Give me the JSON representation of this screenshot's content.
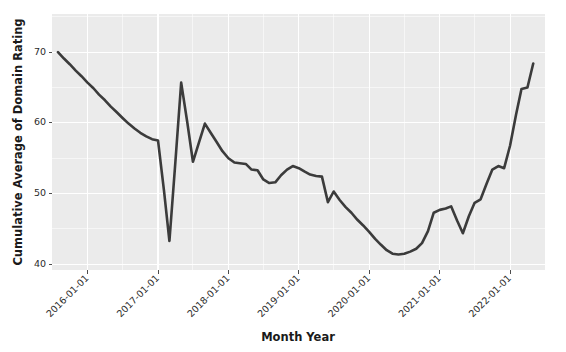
{
  "chart_data": {
    "type": "line",
    "title": "",
    "xlabel": "Month Year",
    "ylabel": "Cumulative Average of Domain Rating",
    "grid": true,
    "legend": false,
    "line_color": "#3b3b3b",
    "panel_color": "#ebebeb",
    "gridline_color": "#ffffff",
    "ylim": [
      39.2,
      75.4
    ],
    "yticks": [
      40,
      50,
      60,
      70
    ],
    "ytick_labels": [
      "40",
      "50",
      "60",
      "70"
    ],
    "xlim": [
      "2015-07-01",
      "2022-07-01"
    ],
    "xticks": [
      "2016-01-01",
      "2017-01-01",
      "2018-01-01",
      "2019-01-01",
      "2020-01-01",
      "2021-01-01",
      "2022-01-01"
    ],
    "xtick_labels": [
      "2016-01-01",
      "2017-01-01",
      "2018-01-01",
      "2019-01-01",
      "2020-01-01",
      "2021-01-01",
      "2022-01-01"
    ],
    "xtick_label_rotation": 45,
    "x": [
      "2015-08-01",
      "2015-09-01",
      "2015-10-01",
      "2015-11-01",
      "2015-12-01",
      "2016-01-01",
      "2016-02-01",
      "2016-03-01",
      "2016-04-01",
      "2016-05-01",
      "2016-06-01",
      "2016-07-01",
      "2016-08-01",
      "2016-09-01",
      "2016-10-01",
      "2016-11-01",
      "2016-12-01",
      "2017-01-01",
      "2017-02-01",
      "2017-03-01",
      "2017-04-01",
      "2017-05-01",
      "2017-06-01",
      "2017-07-01",
      "2017-08-01",
      "2017-09-01",
      "2017-10-01",
      "2017-11-01",
      "2017-12-01",
      "2018-01-01",
      "2018-02-01",
      "2018-03-01",
      "2018-04-01",
      "2018-05-01",
      "2018-06-01",
      "2018-07-01",
      "2018-08-01",
      "2018-09-01",
      "2018-10-01",
      "2018-11-01",
      "2018-12-01",
      "2019-01-01",
      "2019-02-01",
      "2019-03-01",
      "2019-04-01",
      "2019-05-01",
      "2019-06-01",
      "2019-07-01",
      "2019-08-01",
      "2019-09-01",
      "2019-10-01",
      "2019-11-01",
      "2019-12-01",
      "2020-01-01",
      "2020-02-01",
      "2020-03-01",
      "2020-04-01",
      "2020-05-01",
      "2020-06-01",
      "2020-07-01",
      "2020-08-01",
      "2020-09-01",
      "2020-10-01",
      "2020-11-01",
      "2020-12-01",
      "2021-01-01",
      "2021-02-01",
      "2021-03-01",
      "2021-04-01",
      "2021-05-01",
      "2021-06-01",
      "2021-07-01",
      "2021-08-01",
      "2021-09-01",
      "2021-10-01",
      "2021-11-01",
      "2021-12-01",
      "2022-01-01",
      "2022-02-01",
      "2022-03-01",
      "2022-04-01",
      "2022-05-01"
    ],
    "values": [
      70.0,
      69.1,
      68.3,
      67.4,
      66.6,
      65.7,
      64.9,
      64.0,
      63.2,
      62.3,
      61.5,
      60.7,
      59.9,
      59.2,
      58.6,
      58.1,
      57.7,
      57.5,
      50.4,
      43.3,
      54.5,
      65.7,
      60.2,
      54.5,
      57.2,
      59.9,
      58.6,
      57.3,
      56.0,
      55.0,
      54.4,
      54.3,
      54.2,
      53.4,
      53.3,
      52.0,
      51.5,
      51.6,
      52.6,
      53.4,
      53.9,
      53.6,
      53.1,
      52.7,
      52.5,
      52.4,
      48.8,
      50.3,
      49.1,
      48.1,
      47.3,
      46.3,
      45.5,
      44.6,
      43.6,
      42.8,
      42.0,
      41.5,
      41.4,
      41.5,
      41.8,
      42.2,
      43.0,
      44.7,
      47.3,
      47.7,
      47.9,
      48.2,
      46.2,
      44.4,
      46.8,
      48.7,
      49.2,
      51.4,
      53.4,
      53.9,
      53.6,
      56.8,
      61.2,
      64.8,
      65.0,
      68.4
    ],
    "series_name": "Cumulative Average of Domain Rating",
    "annotations": {
      "start_value": 70.0,
      "min_value": 41.4,
      "max_value": 74.0,
      "end_value": 74.0,
      "crash_low": 43.3,
      "post_crash_peak": 65.7
    }
  },
  "axes": {
    "y_title": "Cumulative Average of Domain Rating",
    "x_title": "Month Year"
  }
}
